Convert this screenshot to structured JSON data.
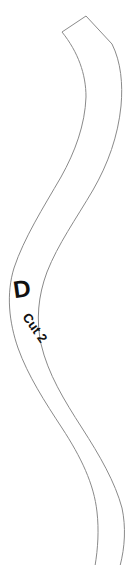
{
  "document": {
    "type": "sewing-pattern-piece",
    "background_color": "#ffffff"
  },
  "piece": {
    "name": "curved-strip-piece-d",
    "outline_color": "#8a8a8a",
    "fill_color": "#ffffff",
    "stroke_width_px": 1,
    "description": "Long S-curved pattern strip, angled cut at top, running off the bottom edge"
  },
  "labels": {
    "piece_letter": "D",
    "cut_instruction": "Cut 2",
    "letter_color": "#111111",
    "letter_rotation_deg": -8,
    "cut_rotation_deg": 55
  },
  "geometry": {
    "canvas_width": 137,
    "canvas_height": 565,
    "outer_edge": "M 86 16 L 112 44 C 121 62 123 84 121 106 C 118 136 108 164 93 190 C 76 219 58 244 47 272 C 38 296 36 320 41 344 C 48 374 64 400 82 428 C 100 456 115 482 122 508 C 126 527 125 547 120 565",
    "inner_edge": "M 62 32 C 78 52 86 74 86 97 C 85 125 75 152 61 177 C 43 208 24 238 14 268 C 6 294 9 322 18 348 C 28 376 45 402 62 428 C 81 457 94 484 97 512 C 99 530 98 548 95 565"
  }
}
